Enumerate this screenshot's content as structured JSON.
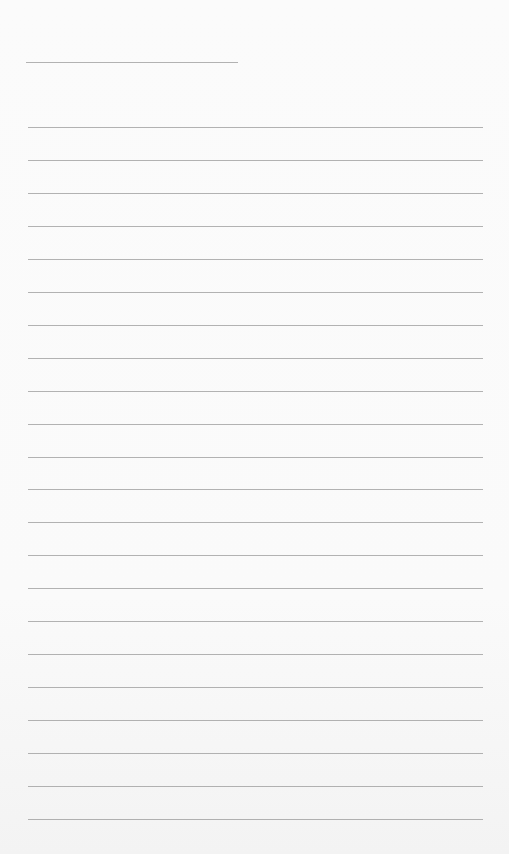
{
  "page": {
    "type": "lined-paper",
    "background_color": "#fafafa",
    "line_color": "#9a9a9a"
  },
  "header_line": {
    "x_start": 26,
    "x_end": 238,
    "y": 62
  },
  "ruled_lines": {
    "count": 22,
    "x_start": 28,
    "x_end": 483,
    "first_y": 127,
    "spacing": 32.95
  }
}
